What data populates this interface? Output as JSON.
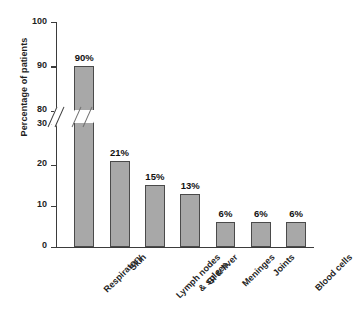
{
  "chart_data": {
    "type": "bar",
    "title": "",
    "xlabel": "",
    "ylabel": "Percentage of patients",
    "categories": [
      "Respiratory",
      "Skin",
      "Lymph nodes\n& spleen",
      "GI & liver",
      "Meninges",
      "Joints",
      "Blood cells"
    ],
    "values": [
      90,
      21,
      15,
      13,
      6,
      6,
      6
    ],
    "data_labels": [
      "90%",
      "21%",
      "15%",
      "13%",
      "6%",
      "6%",
      "6%"
    ],
    "ylim": [
      0,
      100
    ],
    "y_ticks": [
      0,
      10,
      20,
      30,
      80,
      90,
      100
    ],
    "y_tick_labels": [
      "0",
      "10",
      "20",
      "30",
      "80",
      "90",
      "100"
    ],
    "axis_break": {
      "present": true,
      "between": [
        30,
        80
      ],
      "style": "double-slash"
    },
    "grid": false,
    "legend": null,
    "colors": {
      "bar_fill": "#a8a8a8",
      "bar_stroke": "#4a4a4a",
      "axis": "#3b3b3b",
      "text": "#1f1f1f",
      "background": "#ffffff"
    }
  }
}
